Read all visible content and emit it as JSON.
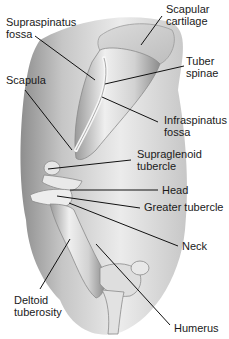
{
  "diagram": {
    "type": "anatomical-illustration",
    "colors": {
      "background": "#ffffff",
      "bone_light": "#e4e4e4",
      "bone_shadow": "#8a8a8a",
      "soft_tissue": "#b9b9b9",
      "leader_line": "#111111",
      "label_text": "#1a1a1a"
    },
    "labels": [
      {
        "id": "scapular-cartilage",
        "lines": [
          "Scapular",
          "cartilage"
        ],
        "x": 166,
        "y": 3
      },
      {
        "id": "supraspinatus-fossa",
        "lines": [
          "Supraspinatus",
          "fossa"
        ],
        "x": 6,
        "y": 16
      },
      {
        "id": "tuber-spinae",
        "lines": [
          "Tuber",
          "spinae"
        ],
        "x": 186,
        "y": 55
      },
      {
        "id": "scapula",
        "lines": [
          "Scapula"
        ],
        "x": 6,
        "y": 74
      },
      {
        "id": "infraspinatus-fossa",
        "lines": [
          "Infraspinatus",
          "fossa"
        ],
        "x": 164,
        "y": 114
      },
      {
        "id": "supraglenoid-tubercle",
        "lines": [
          "Supraglenoid",
          "tubercle"
        ],
        "x": 137,
        "y": 148
      },
      {
        "id": "head",
        "lines": [
          "Head"
        ],
        "x": 162,
        "y": 184
      },
      {
        "id": "greater-tubercle",
        "lines": [
          "Greater tubercle"
        ],
        "x": 144,
        "y": 201
      },
      {
        "id": "neck",
        "lines": [
          "Neck"
        ],
        "x": 182,
        "y": 240
      },
      {
        "id": "deltoid-tuberosity",
        "lines": [
          "Deltoid",
          "tuberosity"
        ],
        "x": 14,
        "y": 294
      },
      {
        "id": "humerus",
        "lines": [
          "Humerus"
        ],
        "x": 174,
        "y": 322
      }
    ],
    "leader_lines": [
      {
        "label": "scapular-cartilage",
        "x1": 162,
        "y1": 16,
        "x2": 141,
        "y2": 45
      },
      {
        "label": "supraspinatus-fossa",
        "x1": 35,
        "y1": 36,
        "x2": 95,
        "y2": 80
      },
      {
        "label": "tuber-spinae",
        "x1": 184,
        "y1": 66,
        "x2": 105,
        "y2": 84
      },
      {
        "label": "scapula",
        "x1": 25,
        "y1": 90,
        "x2": 72,
        "y2": 150
      },
      {
        "label": "infraspinatus-fossa",
        "x1": 158,
        "y1": 122,
        "x2": 102,
        "y2": 97
      },
      {
        "label": "supraglenoid-tubercle",
        "x1": 131,
        "y1": 160,
        "x2": 48,
        "y2": 169
      },
      {
        "label": "head",
        "x1": 158,
        "y1": 190,
        "x2": 70,
        "y2": 190
      },
      {
        "label": "greater-tubercle",
        "x1": 140,
        "y1": 208,
        "x2": 57,
        "y2": 196
      },
      {
        "label": "neck",
        "x1": 178,
        "y1": 246,
        "x2": 69,
        "y2": 203
      },
      {
        "label": "deltoid-tuberosity",
        "x1": 40,
        "y1": 289,
        "x2": 70,
        "y2": 239
      },
      {
        "label": "humerus",
        "x1": 170,
        "y1": 325,
        "x2": 96,
        "y2": 244
      }
    ]
  }
}
